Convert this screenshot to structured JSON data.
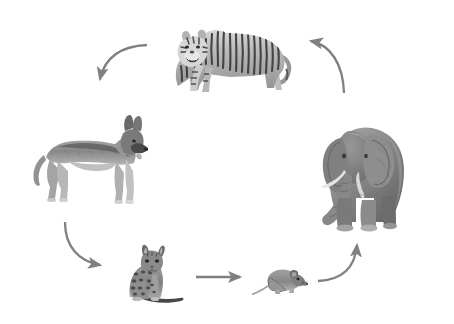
{
  "diagram": {
    "title": "Animal predation cycle",
    "type": "cycle",
    "background_color": "#ffffff",
    "arrow_color": "#808080",
    "style": "grayscale photographic cutouts on white",
    "nodes": [
      {
        "id": "tiger",
        "label": "Tiger",
        "icon": "tiger-icon",
        "facing": "left",
        "position": "top-center",
        "x": 160,
        "y": 14,
        "w": 132,
        "h": 84
      },
      {
        "id": "elephant",
        "label": "Elephant",
        "icon": "elephant-icon",
        "facing": "left-front",
        "position": "right",
        "x": 312,
        "y": 98,
        "w": 106,
        "h": 136
      },
      {
        "id": "dog",
        "label": "Dog",
        "icon": "dog-icon",
        "facing": "right",
        "position": "left",
        "x": 28,
        "y": 113,
        "w": 120,
        "h": 94
      },
      {
        "id": "cat",
        "label": "Cat",
        "icon": "cat-icon",
        "facing": "right",
        "position": "bottom-left",
        "x": 118,
        "y": 241,
        "w": 70,
        "h": 66
      },
      {
        "id": "mouse",
        "label": "Mouse",
        "icon": "mouse-icon",
        "facing": "right",
        "position": "bottom-center",
        "x": 252,
        "y": 264,
        "w": 56,
        "h": 34
      }
    ],
    "edges": [
      {
        "id": "tiger-to-dog",
        "from": "tiger",
        "to": "dog",
        "shape": "curve",
        "direction": "down-left",
        "color": "#808080"
      },
      {
        "id": "dog-to-cat",
        "from": "dog",
        "to": "cat",
        "shape": "curve",
        "direction": "down-right",
        "color": "#808080"
      },
      {
        "id": "cat-to-mouse",
        "from": "cat",
        "to": "mouse",
        "shape": "straight",
        "direction": "right",
        "color": "#808080"
      },
      {
        "id": "mouse-to-elephant",
        "from": "mouse",
        "to": "elephant",
        "shape": "curve",
        "direction": "up-right",
        "color": "#808080"
      },
      {
        "id": "elephant-to-tiger",
        "from": "elephant",
        "to": "tiger",
        "shape": "curve",
        "direction": "up-left",
        "color": "#808080"
      }
    ]
  }
}
